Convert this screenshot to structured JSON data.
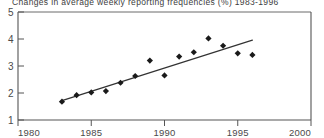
{
  "chart_data": {
    "type": "scatter",
    "title": "Changes in average weekly reporting frequencies (%) 1983-1996",
    "xlabel": "",
    "ylabel": "",
    "xlim": [
      1980,
      2000
    ],
    "ylim": [
      1,
      5
    ],
    "xticks": [
      1980,
      1985,
      1990,
      1995,
      2000
    ],
    "xtick_labels": [
      "1980",
      "1985",
      "1990",
      "1995",
      "2000"
    ],
    "yticks": [
      1,
      2,
      3,
      4,
      5
    ],
    "ytick_labels": [
      "1",
      "2",
      "3",
      "4",
      "5"
    ],
    "grid": false,
    "legend": false,
    "marker": "diamond",
    "marker_color": "#1a1a1a",
    "line_color": "#333333",
    "x": [
      1983,
      1984,
      1985,
      1986,
      1987,
      1988,
      1989,
      1990,
      1991,
      1992,
      1993,
      1994,
      1995,
      1996
    ],
    "values": [
      1.68,
      1.92,
      2.02,
      2.07,
      2.38,
      2.63,
      3.2,
      2.65,
      3.35,
      3.51,
      4.02,
      3.75,
      3.47,
      3.41
    ],
    "series": [
      {
        "name": "Average weekly reporting frequency change",
        "type": "scatter",
        "x": [
          1983,
          1984,
          1985,
          1986,
          1987,
          1988,
          1989,
          1990,
          1991,
          1992,
          1993,
          1994,
          1995,
          1996
        ],
        "values": [
          1.68,
          1.92,
          2.02,
          2.07,
          2.38,
          2.63,
          3.2,
          2.65,
          3.35,
          3.51,
          4.02,
          3.75,
          3.47,
          3.41
        ]
      },
      {
        "name": "Linear trend line",
        "type": "line",
        "x": [
          1983,
          1996
        ],
        "values": [
          1.72,
          3.96
        ]
      }
    ],
    "annotations": []
  },
  "axes": {
    "y_labels": [
      "5",
      "4",
      "3",
      "2",
      "1"
    ],
    "x_labels": [
      "1980",
      "1985",
      "1990",
      "1995",
      "2000"
    ]
  },
  "title": {
    "text": "Changes in average weekly reporting frequencies (%) 1983-1996"
  }
}
